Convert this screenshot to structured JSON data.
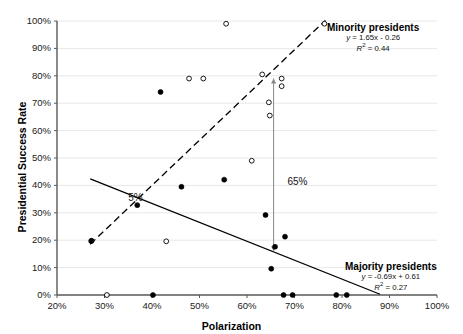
{
  "chart_data": {
    "type": "scatter",
    "title": "",
    "xlabel": "Polarization",
    "ylabel": "Presidential Success Rate",
    "xlim": [
      20,
      100
    ],
    "ylim": [
      0,
      100
    ],
    "xticks": [
      "20%",
      "30%",
      "40%",
      "50%",
      "60%",
      "70%",
      "80%",
      "90%",
      "100%"
    ],
    "xtick_values": [
      20,
      30,
      40,
      50,
      60,
      70,
      80,
      90,
      100
    ],
    "yticks": [
      "0%",
      "10%",
      "20%",
      "30%",
      "40%",
      "50%",
      "60%",
      "70%",
      "80%",
      "90%",
      "100%"
    ],
    "ytick_values": [
      0,
      10,
      20,
      30,
      40,
      50,
      60,
      70,
      80,
      90,
      100
    ],
    "grid": "horizontal",
    "legend_position": "none",
    "series": [
      {
        "name": "Minority presidents",
        "marker": "open-circle",
        "points": [
          {
            "x": 30.5,
            "y": 0.0
          },
          {
            "x": 27.3,
            "y": 19.8
          },
          {
            "x": 43.0,
            "y": 19.6
          },
          {
            "x": 47.8,
            "y": 79.0
          },
          {
            "x": 50.8,
            "y": 79.0
          },
          {
            "x": 55.6,
            "y": 99.0
          },
          {
            "x": 61.0,
            "y": 49.0
          },
          {
            "x": 63.2,
            "y": 80.5
          },
          {
            "x": 64.6,
            "y": 70.3
          },
          {
            "x": 64.8,
            "y": 65.5
          },
          {
            "x": 67.3,
            "y": 79.0
          },
          {
            "x": 67.3,
            "y": 76.2
          },
          {
            "x": 76.3,
            "y": 99.0
          }
        ]
      },
      {
        "name": "Majority presidents",
        "marker": "filled-circle",
        "points": [
          {
            "x": 40.2,
            "y": 0.0
          },
          {
            "x": 67.7,
            "y": 0.0
          },
          {
            "x": 69.6,
            "y": 0.0
          },
          {
            "x": 78.8,
            "y": 0.0
          },
          {
            "x": 81.0,
            "y": 0.0
          },
          {
            "x": 27.2,
            "y": 19.7
          },
          {
            "x": 36.9,
            "y": 32.8
          },
          {
            "x": 41.8,
            "y": 74.1
          },
          {
            "x": 46.2,
            "y": 39.5
          },
          {
            "x": 55.2,
            "y": 42.1
          },
          {
            "x": 63.9,
            "y": 29.2
          },
          {
            "x": 65.9,
            "y": 17.6
          },
          {
            "x": 68.0,
            "y": 21.3
          },
          {
            "x": 65.1,
            "y": 9.6
          }
        ]
      }
    ],
    "trendlines": [
      {
        "name": "Minority presidents",
        "style": "dashed",
        "slope": 1.65,
        "intercept": -0.26,
        "r2": 0.44,
        "equation": "y = 1.65x - 0.26",
        "r2_text": "R² = 0.44",
        "x_start": 27.0,
        "x_end": 76.5
      },
      {
        "name": "Majority presidents",
        "style": "solid",
        "slope": -0.69,
        "intercept": 0.61,
        "r2": 0.27,
        "equation": "y = -0.69x + 0.61",
        "r2_text": "R² = 0.27",
        "x_start": 27.0,
        "x_end": 88.0
      }
    ],
    "annotations": [
      {
        "name": "gap-5-percent",
        "text": "5%",
        "x": 35.0,
        "y": 35.0
      },
      {
        "name": "gap-65-percent",
        "text": "65%",
        "x": 68.5,
        "y": 41.0
      }
    ],
    "gap_marker": {
      "name": "vertical-gap-arrow",
      "x": 65.6,
      "y_top": 79.0,
      "y_bottom": 16.0,
      "label": "65%"
    }
  },
  "annotations_text": {
    "minority": {
      "title": "Minority presidents",
      "equation_prefix": "y",
      "equation_rest": " = 1.65x - 0.26",
      "r2_prefix": "R",
      "r2_sup": "2",
      "r2_rest": " = 0.44"
    },
    "majority": {
      "title": "Majority presidents",
      "equation_prefix": "y",
      "equation_rest": " = -0.69x + 0.61",
      "r2_prefix": "R",
      "r2_sup": "2",
      "r2_rest": " = 0.27"
    }
  },
  "colors": {
    "axis": "#595959",
    "grid": "#e8e8e8",
    "marker_fill": "#000000",
    "marker_open": "#ffffff",
    "trend": "#000000",
    "text": "#000000"
  }
}
